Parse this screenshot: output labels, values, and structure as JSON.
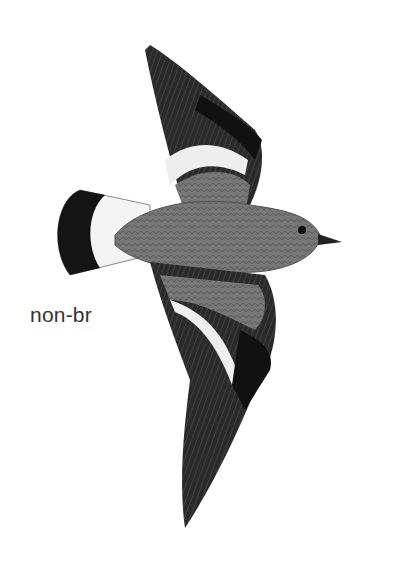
{
  "illustration": {
    "subject": "bird in flight, top view",
    "plumage_label": "non-br",
    "colors": {
      "background": "#ffffff",
      "body": "#6e6e6e",
      "wing_dark": "#1e1e1e",
      "wing_bar": "#f2f2f2",
      "tail_band": "#151515",
      "text": "#333333"
    }
  }
}
